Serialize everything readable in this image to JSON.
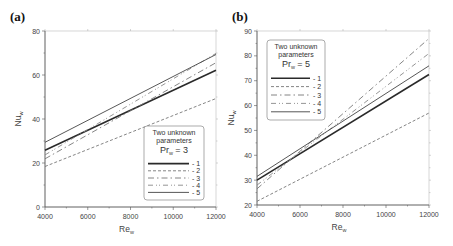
{
  "chart_data": [
    {
      "type": "line",
      "panel": "(a)",
      "title": "",
      "xlabel": "Re_w",
      "ylabel": "Nu_w",
      "xlim": [
        4000,
        12000
      ],
      "ylim": [
        0,
        80
      ],
      "xticks": [
        4000,
        6000,
        8000,
        10000,
        12000
      ],
      "yticks": [
        0,
        20,
        40,
        60,
        80
      ],
      "grid": false,
      "legend": {
        "position": "lower right",
        "title_lines": [
          "Two unknown",
          "parameters"
        ],
        "param": "Pr_w = 3",
        "param_main": "Pr",
        "param_sub": "w",
        "param_value": "= 3"
      },
      "series": [
        {
          "name": "1",
          "style": "solid-thick",
          "x": [
            4000,
            12000
          ],
          "values": [
            25.8,
            62.2
          ]
        },
        {
          "name": "2",
          "style": "dashed",
          "x": [
            4000,
            12000
          ],
          "values": [
            18.4,
            49.3
          ]
        },
        {
          "name": "3",
          "style": "dash-dot",
          "x": [
            4000,
            12000
          ],
          "values": [
            21.9,
            65.6
          ]
        },
        {
          "name": "4",
          "style": "dash-dot-dot",
          "x": [
            4000,
            12000
          ],
          "values": [
            23.7,
            69.8
          ]
        },
        {
          "name": "5",
          "style": "solid-thin",
          "x": [
            4000,
            12000
          ],
          "values": [
            29.4,
            69.3
          ]
        }
      ]
    },
    {
      "type": "line",
      "panel": "(b)",
      "title": "",
      "xlabel": "Re_w",
      "ylabel": "Nu_w",
      "xlim": [
        4000,
        12000
      ],
      "ylim": [
        20,
        90
      ],
      "xticks": [
        4000,
        6000,
        8000,
        10000,
        12000
      ],
      "yticks": [
        20,
        30,
        40,
        50,
        60,
        70,
        80,
        90
      ],
      "grid": false,
      "legend": {
        "position": "upper left",
        "title_lines": [
          "Two unknown",
          "parameters"
        ],
        "param": "Pr_w = 5",
        "param_main": "Pr",
        "param_sub": "w",
        "param_value": "= 5"
      },
      "series": [
        {
          "name": "1",
          "style": "solid-thick",
          "x": [
            4000,
            12000
          ],
          "values": [
            30.0,
            72.5
          ]
        },
        {
          "name": "2",
          "style": "dashed",
          "x": [
            4000,
            12000
          ],
          "values": [
            21.5,
            57.0
          ]
        },
        {
          "name": "3",
          "style": "dash-dot",
          "x": [
            4000,
            12000
          ],
          "values": [
            26.5,
            87.0
          ]
        },
        {
          "name": "4",
          "style": "dash-dot-dot",
          "x": [
            4000,
            12000
          ],
          "values": [
            28.0,
            81.0
          ]
        },
        {
          "name": "5",
          "style": "solid-thin",
          "x": [
            4000,
            12000
          ],
          "values": [
            31.5,
            76.0
          ]
        }
      ]
    }
  ],
  "panels": [
    {
      "label": "(a)",
      "xlabel_main": "Re",
      "xlabel_sub": "w",
      "ylabel_main": "Nu",
      "ylabel_sub": "w"
    },
    {
      "label": "(b)",
      "xlabel_main": "Re",
      "xlabel_sub": "w",
      "ylabel_main": "Nu",
      "ylabel_sub": "w"
    }
  ],
  "colors": {
    "axis": "#555555",
    "line_dark": "#333333",
    "line_mid": "#777777",
    "legend_border": "#888888"
  }
}
